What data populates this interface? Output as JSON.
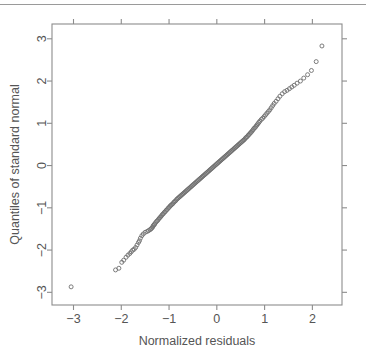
{
  "figure": {
    "type": "qq-plot",
    "background": "#ffffff",
    "frame_color": "#8c8c8c",
    "point_color": "#6e6e6e",
    "text_color": "#555555",
    "top_rule_color": "#9a9a9a"
  },
  "chart_data": {
    "type": "scatter",
    "title": "",
    "xlabel": "Normalized residuals",
    "ylabel": "Quantiles of standard normal",
    "xlim": [
      -3.45,
      2.62
    ],
    "ylim": [
      -3.3,
      3.35
    ],
    "xticks": [
      -3,
      -2,
      -1,
      0,
      1,
      2
    ],
    "xticklabels": [
      "−3",
      "−2",
      "−1",
      "0",
      "1",
      "2"
    ],
    "yticks": [
      -3,
      -2,
      -1,
      0,
      1,
      2,
      3
    ],
    "yticklabels": [
      "−3",
      "−2",
      "−1",
      "0",
      "1",
      "2",
      "3"
    ],
    "grid": false,
    "legend": null,
    "marker": "open-circle",
    "marker_size": 4,
    "series": [
      {
        "name": "residual quantiles",
        "x": [
          -3.05,
          -2.12,
          -2.05,
          -1.99,
          -1.95,
          -1.9,
          -1.86,
          -1.82,
          -1.79,
          -1.76,
          -1.73,
          -1.7,
          -1.67,
          -1.64,
          -1.62,
          -1.6,
          -1.57,
          -1.54,
          -1.5,
          -1.46,
          -1.43,
          -1.4,
          -1.38,
          -1.36,
          -1.34,
          -1.33,
          -1.31,
          -1.3,
          -1.28,
          -1.26,
          -1.24,
          -1.22,
          -1.2,
          -1.18,
          -1.16,
          -1.14,
          -1.12,
          -1.1,
          -1.08,
          -1.06,
          -1.04,
          -1.02,
          -1.0,
          -0.98,
          -0.96,
          -0.94,
          -0.92,
          -0.9,
          -0.88,
          -0.86,
          -0.84,
          -0.82,
          -0.8,
          -0.78,
          -0.76,
          -0.74,
          -0.72,
          -0.7,
          -0.68,
          -0.66,
          -0.64,
          -0.62,
          -0.6,
          -0.58,
          -0.56,
          -0.54,
          -0.52,
          -0.5,
          -0.48,
          -0.46,
          -0.44,
          -0.42,
          -0.4,
          -0.38,
          -0.36,
          -0.34,
          -0.32,
          -0.3,
          -0.28,
          -0.26,
          -0.24,
          -0.22,
          -0.2,
          -0.18,
          -0.16,
          -0.14,
          -0.12,
          -0.1,
          -0.08,
          -0.06,
          -0.04,
          -0.02,
          0.0,
          0.02,
          0.04,
          0.06,
          0.08,
          0.1,
          0.12,
          0.14,
          0.16,
          0.18,
          0.2,
          0.22,
          0.24,
          0.26,
          0.28,
          0.3,
          0.32,
          0.34,
          0.36,
          0.38,
          0.4,
          0.42,
          0.44,
          0.46,
          0.48,
          0.5,
          0.52,
          0.54,
          0.56,
          0.58,
          0.6,
          0.62,
          0.64,
          0.66,
          0.68,
          0.7,
          0.72,
          0.74,
          0.76,
          0.78,
          0.8,
          0.82,
          0.84,
          0.86,
          0.88,
          0.9,
          0.93,
          0.96,
          0.99,
          1.02,
          1.05,
          1.08,
          1.11,
          1.14,
          1.17,
          1.2,
          1.24,
          1.28,
          1.32,
          1.37,
          1.42,
          1.47,
          1.52,
          1.57,
          1.62,
          1.68,
          1.75,
          1.82,
          1.9,
          1.98,
          2.08,
          2.2
        ],
        "y": [
          -2.87,
          -2.47,
          -2.43,
          -2.29,
          -2.24,
          -2.17,
          -2.12,
          -2.08,
          -2.04,
          -2.0,
          -1.98,
          -1.94,
          -1.88,
          -1.82,
          -1.78,
          -1.72,
          -1.66,
          -1.62,
          -1.58,
          -1.56,
          -1.54,
          -1.52,
          -1.5,
          -1.48,
          -1.45,
          -1.42,
          -1.4,
          -1.38,
          -1.35,
          -1.32,
          -1.3,
          -1.27,
          -1.24,
          -1.22,
          -1.19,
          -1.16,
          -1.14,
          -1.11,
          -1.09,
          -1.06,
          -1.04,
          -1.01,
          -0.99,
          -0.96,
          -0.94,
          -0.92,
          -0.9,
          -0.87,
          -0.85,
          -0.83,
          -0.8,
          -0.78,
          -0.76,
          -0.74,
          -0.72,
          -0.7,
          -0.68,
          -0.66,
          -0.64,
          -0.62,
          -0.6,
          -0.58,
          -0.56,
          -0.54,
          -0.52,
          -0.5,
          -0.48,
          -0.46,
          -0.44,
          -0.42,
          -0.4,
          -0.38,
          -0.36,
          -0.34,
          -0.32,
          -0.3,
          -0.28,
          -0.26,
          -0.24,
          -0.22,
          -0.2,
          -0.18,
          -0.16,
          -0.14,
          -0.12,
          -0.1,
          -0.08,
          -0.06,
          -0.04,
          -0.02,
          0.0,
          0.02,
          0.04,
          0.06,
          0.08,
          0.1,
          0.12,
          0.14,
          0.16,
          0.18,
          0.2,
          0.22,
          0.24,
          0.26,
          0.28,
          0.3,
          0.32,
          0.34,
          0.36,
          0.38,
          0.4,
          0.42,
          0.44,
          0.46,
          0.48,
          0.5,
          0.52,
          0.54,
          0.56,
          0.58,
          0.6,
          0.62,
          0.65,
          0.67,
          0.69,
          0.72,
          0.74,
          0.77,
          0.79,
          0.82,
          0.85,
          0.88,
          0.9,
          0.93,
          0.96,
          0.99,
          1.02,
          1.05,
          1.09,
          1.12,
          1.16,
          1.2,
          1.24,
          1.28,
          1.32,
          1.37,
          1.42,
          1.47,
          1.52,
          1.58,
          1.64,
          1.7,
          1.75,
          1.78,
          1.82,
          1.86,
          1.9,
          1.95,
          2.0,
          2.07,
          2.15,
          2.25,
          2.46,
          2.83
        ]
      }
    ]
  }
}
